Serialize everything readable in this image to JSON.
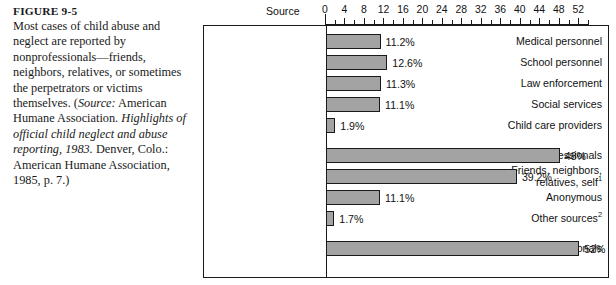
{
  "figure": {
    "label": "FIGURE 9-5",
    "caption_lines": [
      {
        "text": "Most cases of child abuse and ",
        "italic": false
      },
      {
        "text": "neglect are reported by ",
        "italic": false
      },
      {
        "text": "nonprofessionals—friends, ",
        "italic": false
      },
      {
        "text": "neighbors, relatives, or ",
        "italic": false
      },
      {
        "text": "sometimes the perpetrators or ",
        "italic": false
      },
      {
        "text": "victims themselves. (",
        "italic": false
      },
      {
        "text": "Source:",
        "italic": true
      },
      {
        "text": " American Humane Association. ",
        "italic": false
      },
      {
        "text": "Highlights of official child neglect and abuse reporting, 1983.",
        "italic": true
      },
      {
        "text": " Denver, Colo.: American Humane Association, 1985, p. 7.)",
        "italic": false
      }
    ],
    "caption_plain": "Most cases of child abuse and neglect are reported by nonprofessionals—friends, neighbors, relatives, or sometimes the perpetrators or victims themselves. (Source: American Humane Association. Highlights of official child neglect and abuse reporting, 1983. Denver, Colo.: American Humane Association, 1985, p. 7.)"
  },
  "chart_data": {
    "type": "bar",
    "orientation": "horizontal",
    "title": "",
    "xlabel": "",
    "ylabel": "Source",
    "axis_title": "Source",
    "xlim": [
      0,
      54
    ],
    "tick_labels": [
      "0",
      "4",
      "8",
      "12",
      "16",
      "20",
      "24",
      "28",
      "32",
      "36",
      "40",
      "44",
      "48",
      "52"
    ],
    "tick_values": [
      0,
      4,
      8,
      12,
      16,
      20,
      24,
      28,
      32,
      36,
      40,
      44,
      48,
      52
    ],
    "minor_tick_interval": 2,
    "grid": false,
    "legend": null,
    "bar_color": "#a3a3a3",
    "bar_border_color": "#1a1a1a",
    "categories": [
      "Medical personnel",
      "School personnel",
      "Law enforcement",
      "Social services",
      "Child care providers",
      "Total professionals",
      "Friends, neighbors, relatives, self¹",
      "Anonymous",
      "Other sources²",
      "Total nonprofessionals"
    ],
    "values": [
      11.2,
      12.6,
      11.3,
      11.1,
      1.9,
      48,
      39.2,
      11.1,
      1.7,
      52
    ],
    "value_labels": [
      "11.2%",
      "12.6%",
      "11.3%",
      "11.1%",
      "1.9%",
      "48%",
      "39.2%",
      "11.1%",
      "1.7%",
      "52%"
    ],
    "bars": [
      {
        "label": "Medical personnel",
        "label_l1": "Medical personnel",
        "label_l2": "",
        "sup": "",
        "value": 11.2,
        "value_label": "11.2%",
        "gap_before": false
      },
      {
        "label": "School personnel",
        "label_l1": "School personnel",
        "label_l2": "",
        "sup": "",
        "value": 12.6,
        "value_label": "12.6%",
        "gap_before": false
      },
      {
        "label": "Law enforcement",
        "label_l1": "Law enforcement",
        "label_l2": "",
        "sup": "",
        "value": 11.3,
        "value_label": "11.3%",
        "gap_before": false
      },
      {
        "label": "Social services",
        "label_l1": "Social services",
        "label_l2": "",
        "sup": "",
        "value": 11.1,
        "value_label": "11.1%",
        "gap_before": false
      },
      {
        "label": "Child care providers",
        "label_l1": "Child care providers",
        "label_l2": "",
        "sup": "",
        "value": 1.9,
        "value_label": "1.9%",
        "gap_before": false
      },
      {
        "label": "Total professionals",
        "label_l1": "Total professionals",
        "label_l2": "",
        "sup": "",
        "value": 48,
        "value_label": "48%",
        "gap_before": true
      },
      {
        "label": "Friends, neighbors, relatives, self",
        "label_l1": "Friends, neighbors,",
        "label_l2": "relatives, self",
        "sup": "1",
        "value": 39.2,
        "value_label": "39.2%",
        "gap_before": false
      },
      {
        "label": "Anonymous",
        "label_l1": "Anonymous",
        "label_l2": "",
        "sup": "",
        "value": 11.1,
        "value_label": "11.1%",
        "gap_before": false
      },
      {
        "label": "Other sources",
        "label_l1": "Other sources",
        "label_l2": "",
        "sup": "2",
        "value": 1.7,
        "value_label": "1.7%",
        "gap_before": false
      },
      {
        "label": "Total nonprofessionals",
        "label_l1": "Total nonprofessionals",
        "label_l2": "",
        "sup": "",
        "value": 52,
        "value_label": "52%",
        "gap_before": true
      }
    ]
  }
}
